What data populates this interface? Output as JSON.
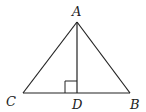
{
  "diagram": {
    "type": "triangle-with-altitude",
    "labels": {
      "A": "A",
      "B": "B",
      "C": "C",
      "D": "D"
    },
    "points": {
      "A": [
        77,
        22
      ],
      "B": [
        130,
        93
      ],
      "C": [
        23,
        93
      ],
      "D": [
        77,
        93
      ]
    },
    "right_angle_at": "D",
    "stroke_color": "#222222"
  }
}
